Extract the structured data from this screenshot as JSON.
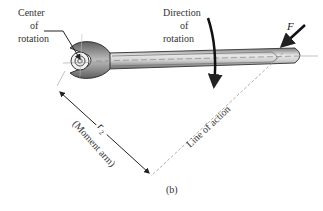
{
  "diagram": {
    "labels": {
      "center_line1": "Center",
      "center_line2": "of",
      "center_line3": "rotation",
      "direction_line1": "Direction",
      "direction_line2": "of",
      "direction_line3": "rotation",
      "force": "F",
      "moment_arm_symbol": "r",
      "moment_arm_subscript": "2",
      "moment_arm_text": "(Moment arm)",
      "line_of_action": "Line of action",
      "caption": "(b)"
    },
    "colors": {
      "ink": "#222222",
      "wrench_dark": "#6e6e6e",
      "wrench_light": "#e6e6e6",
      "dashed": "#999999"
    }
  }
}
